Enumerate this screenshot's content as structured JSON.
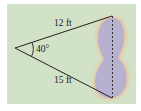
{
  "diagram": {
    "type": "geometry-triangle-pond",
    "sides": [
      {
        "id": "top",
        "label": "12 ft",
        "length": 12,
        "unit": "ft"
      },
      {
        "id": "bottom",
        "label": "15 ft",
        "length": 15,
        "unit": "ft"
      }
    ],
    "angle": {
      "label": "40°",
      "degrees": 40
    },
    "unknown_side": {
      "style": "dashed",
      "spans": "pond"
    },
    "colors": {
      "background": "#d2e2c7",
      "pond_fill": "#b6b1cf",
      "pond_halo": "#e8c9a8",
      "lines": "#222222"
    }
  }
}
